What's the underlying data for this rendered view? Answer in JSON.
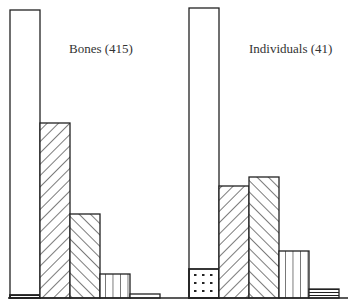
{
  "chart_data": [
    {
      "type": "bar",
      "title": "Bones (415)",
      "xlabel": "",
      "ylabel": "",
      "grid": false,
      "legend": null,
      "categories": [
        "1",
        "2",
        "3",
        "4",
        "5"
      ],
      "series": [
        {
          "name": "main",
          "values": [
            288,
            175,
            84,
            24,
            4
          ],
          "patterns": [
            "plain",
            "diag-right",
            "diag-left",
            "vertical",
            "plain"
          ]
        },
        {
          "name": "base-segment",
          "values": [
            3,
            0,
            0,
            0,
            0
          ],
          "patterns": [
            "horizontal",
            "",
            "",
            "",
            ""
          ]
        }
      ],
      "ylim": [
        0,
        290
      ]
    },
    {
      "type": "bar",
      "title": "Individuals (41)",
      "xlabel": "",
      "ylabel": "",
      "grid": false,
      "legend": null,
      "categories": [
        "1",
        "2",
        "3",
        "4",
        "5"
      ],
      "series": [
        {
          "name": "main",
          "values": [
            290,
            112,
            121,
            47,
            9
          ],
          "patterns": [
            "plain",
            "diag-right",
            "diag-left",
            "vertical",
            "horizontal"
          ]
        },
        {
          "name": "base-segment",
          "values": [
            29,
            0,
            0,
            0,
            0
          ],
          "patterns": [
            "dotted",
            "",
            "",
            "",
            ""
          ]
        }
      ],
      "ylim": [
        0,
        290
      ]
    }
  ],
  "labels": {
    "bones": "Bones (415)",
    "individuals": "Individuals (41)"
  }
}
